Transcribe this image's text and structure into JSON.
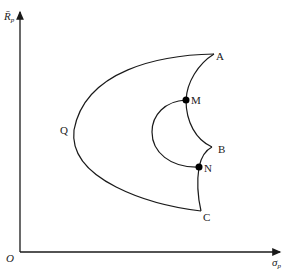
{
  "diagram": {
    "type": "efficient-frontier",
    "axes": {
      "y_label": "R̄",
      "y_label_sub": "p",
      "x_label": "σ",
      "x_label_sub": "p",
      "origin_label": "O"
    },
    "points": {
      "A": "A",
      "B": "B",
      "C": "C",
      "Q": "Q",
      "M": "M",
      "N": "N"
    },
    "colors": {
      "line": "#1a1a1a",
      "text": "#222222",
      "background": "#ffffff"
    }
  }
}
